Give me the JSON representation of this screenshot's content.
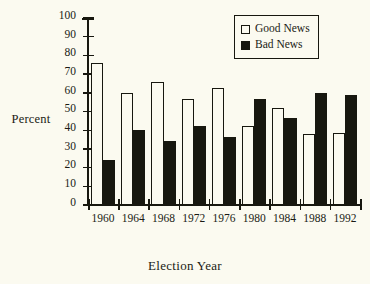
{
  "chart_data": {
    "type": "bar",
    "title": "",
    "xlabel": "Election Year",
    "ylabel": "Percent",
    "categories": [
      "1960",
      "1964",
      "1968",
      "1972",
      "1976",
      "1980",
      "1984",
      "1988",
      "1992"
    ],
    "series": [
      {
        "name": "Good News",
        "swatch": "open-square",
        "color": "#fbfaf0",
        "values": [
          76,
          60,
          66,
          56.5,
          62.5,
          42,
          52,
          38,
          38.5
        ]
      },
      {
        "name": "Bad News",
        "swatch": "filled-square",
        "color": "#17170f",
        "values": [
          24,
          40,
          34,
          42.5,
          36.5,
          56.5,
          46.5,
          60,
          59
        ]
      }
    ],
    "ylim": [
      0,
      100
    ],
    "ytick_labels": [
      "100",
      "90",
      "80",
      "70",
      "60",
      "50",
      "40",
      "30",
      "20",
      "10",
      "0"
    ],
    "ytick_values": [
      100,
      90,
      80,
      70,
      60,
      50,
      40,
      30,
      20,
      10,
      0
    ],
    "grid": false,
    "legend_position": "top-right",
    "legend_entries": [
      "Good News",
      "Bad News"
    ]
  },
  "colors": {
    "background": "#fbfaf0",
    "ink": "#17170f"
  }
}
